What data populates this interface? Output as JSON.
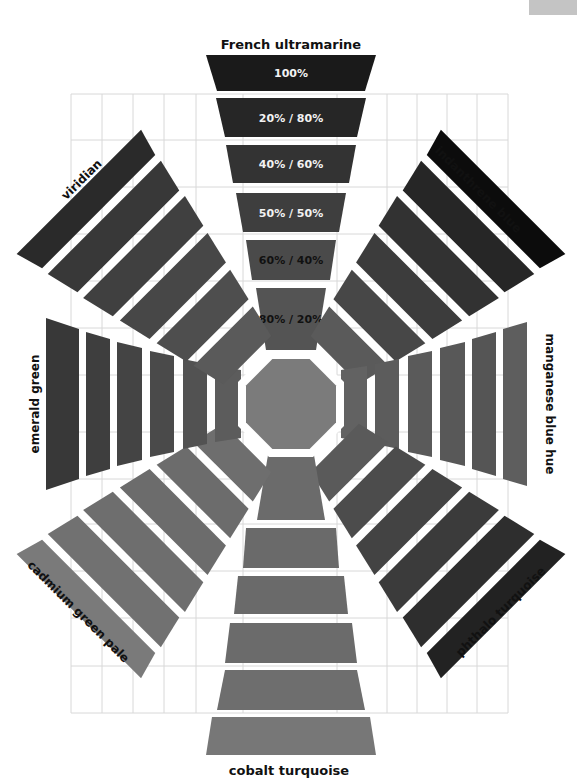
{
  "corner_tab": {
    "color": "#c4c4c4"
  },
  "center": {
    "x": 291,
    "y": 404,
    "octagon_radius": 47,
    "octagon_color": "#7b7b7b"
  },
  "grid": {
    "x0": 71,
    "x1": 508,
    "y0": 94,
    "y1": 713,
    "columns": [
      71,
      102,
      133,
      164,
      196,
      243,
      337,
      387,
      417,
      447,
      477,
      508
    ],
    "rows": [
      94,
      140,
      187,
      234,
      281,
      328,
      375,
      432,
      479,
      524,
      571,
      618,
      666,
      713
    ],
    "color": "#d8d8d8"
  },
  "arms": [
    {
      "name": "French ultramarine",
      "direction": "top",
      "angle": 0,
      "label": {
        "text": "French ultramarine",
        "x": 291,
        "y": 45,
        "rotate": 0,
        "size": 13
      },
      "swatches": [
        {
          "r0": 54,
          "r1": 116,
          "w0": 25,
          "w1": 35,
          "color": "#545454",
          "text": "80% / 20%",
          "text_color": "#111111"
        },
        {
          "r0": 124,
          "r1": 164,
          "w0": 39,
          "w1": 45,
          "color": "#4a4a4a",
          "text": "60% / 40%",
          "text_color": "#111111"
        },
        {
          "r0": 172,
          "r1": 211,
          "w0": 48,
          "w1": 55,
          "color": "#3e3e3e",
          "text": "50% / 50%",
          "text_color": "#f2f2f2"
        },
        {
          "r0": 221,
          "r1": 259,
          "w0": 58,
          "w1": 65,
          "color": "#333333",
          "text": "40% / 60%",
          "text_color": "#f2f2f2"
        },
        {
          "r0": 267,
          "r1": 306,
          "w0": 66,
          "w1": 75,
          "color": "#262626",
          "text": "20% / 80%",
          "text_color": "#f2f2f2"
        },
        {
          "r0": 313,
          "r1": 349,
          "w0": 74,
          "w1": 85,
          "color": "#1a1a1a",
          "text": "100%",
          "text_color": "#f2f2f2"
        }
      ]
    },
    {
      "name": "indanthrene blue",
      "direction": "top-right",
      "angle": 45,
      "label": {
        "text": "indanthrene blue",
        "x": 478,
        "y": 190,
        "rotate": 45,
        "size": 12
      },
      "swatches": [
        {
          "r0": 62,
          "r1": 96,
          "w0": 34,
          "w1": 42,
          "color": "#5a5a5a"
        },
        {
          "r0": 104,
          "r1": 138,
          "w0": 44,
          "w1": 52,
          "color": "#474747"
        },
        {
          "r0": 146,
          "r1": 180,
          "w0": 54,
          "w1": 62,
          "color": "#3c3c3c"
        },
        {
          "r0": 188,
          "r1": 222,
          "w0": 64,
          "w1": 72,
          "color": "#323232"
        },
        {
          "r0": 230,
          "r1": 264,
          "w0": 72,
          "w1": 80,
          "color": "#262626"
        },
        {
          "r0": 272,
          "r1": 300,
          "w0": 80,
          "w1": 88,
          "color": "#0c0c0c"
        }
      ]
    },
    {
      "name": "manganese blue hue",
      "direction": "right",
      "angle": 90,
      "label": {
        "text": "manganese blue hue",
        "x": 549,
        "y": 404,
        "rotate": 90,
        "size": 12
      },
      "swatches": [
        {
          "r0": 50,
          "r1": 76,
          "w0": 34,
          "w1": 38,
          "color": "#626262"
        },
        {
          "r0": 84,
          "r1": 108,
          "w0": 40,
          "w1": 45,
          "color": "#5c5c5c"
        },
        {
          "r0": 117,
          "r1": 141,
          "w0": 48,
          "w1": 53,
          "color": "#5a5a5a"
        },
        {
          "r0": 149,
          "r1": 174,
          "w0": 56,
          "w1": 62,
          "color": "#585858"
        },
        {
          "r0": 181,
          "r1": 205,
          "w0": 65,
          "w1": 72,
          "color": "#555555"
        },
        {
          "r0": 212,
          "r1": 236,
          "w0": 75,
          "w1": 82,
          "color": "#5e5e5e"
        }
      ]
    },
    {
      "name": "phthalo turquoise",
      "direction": "bottom-right",
      "angle": 135,
      "label": {
        "text": "phthalo turquoise",
        "x": 501,
        "y": 612,
        "rotate": -45,
        "size": 12
      },
      "swatches": [
        {
          "r0": 62,
          "r1": 96,
          "w0": 34,
          "w1": 42,
          "color": "#5a5a5a"
        },
        {
          "r0": 104,
          "r1": 138,
          "w0": 44,
          "w1": 52,
          "color": "#4c4c4c"
        },
        {
          "r0": 146,
          "r1": 180,
          "w0": 54,
          "w1": 62,
          "color": "#434343"
        },
        {
          "r0": 188,
          "r1": 222,
          "w0": 64,
          "w1": 72,
          "color": "#3b3b3b"
        },
        {
          "r0": 230,
          "r1": 264,
          "w0": 72,
          "w1": 80,
          "color": "#2e2e2e"
        },
        {
          "r0": 272,
          "r1": 300,
          "w0": 80,
          "w1": 88,
          "color": "#222222"
        }
      ]
    },
    {
      "name": "cobalt turquoise",
      "direction": "bottom",
      "angle": 180,
      "label": {
        "text": "cobalt turquoise",
        "x": 289,
        "y": 771,
        "rotate": 0,
        "size": 13
      },
      "swatches": [
        {
          "r0": 51,
          "r1": 116,
          "w0": 23,
          "w1": 34,
          "color": "#6b6b6b"
        },
        {
          "r0": 124,
          "r1": 164,
          "w0": 45,
          "w1": 48,
          "color": "#6a6a6a"
        },
        {
          "r0": 172,
          "r1": 210,
          "w0": 53,
          "w1": 57,
          "color": "#6a6a6a"
        },
        {
          "r0": 219,
          "r1": 259,
          "w0": 61,
          "w1": 66,
          "color": "#6b6b6b"
        },
        {
          "r0": 266,
          "r1": 306,
          "w0": 66,
          "w1": 74,
          "color": "#6e6e6e"
        },
        {
          "r0": 313,
          "r1": 351,
          "w0": 79,
          "w1": 85,
          "color": "#777777"
        }
      ]
    },
    {
      "name": "cadmium green pale",
      "direction": "bottom-left",
      "angle": 225,
      "label": {
        "text": "cadmium green pale",
        "x": 78,
        "y": 612,
        "rotate": 45,
        "size": 12
      },
      "swatches": [
        {
          "r0": 62,
          "r1": 96,
          "w0": 34,
          "w1": 42,
          "color": "#6e6e6e"
        },
        {
          "r0": 104,
          "r1": 138,
          "w0": 44,
          "w1": 52,
          "color": "#6c6c6c"
        },
        {
          "r0": 146,
          "r1": 180,
          "w0": 54,
          "w1": 62,
          "color": "#6c6c6c"
        },
        {
          "r0": 188,
          "r1": 222,
          "w0": 64,
          "w1": 72,
          "color": "#6e6e6e"
        },
        {
          "r0": 230,
          "r1": 264,
          "w0": 72,
          "w1": 80,
          "color": "#717171"
        },
        {
          "r0": 272,
          "r1": 300,
          "w0": 80,
          "w1": 88,
          "color": "#7a7a7a"
        }
      ]
    },
    {
      "name": "emerald green",
      "direction": "left",
      "angle": 270,
      "label": {
        "text": "emerald green",
        "x": 35,
        "y": 404,
        "rotate": -90,
        "size": 12
      },
      "swatches": [
        {
          "r0": 50,
          "r1": 76,
          "w0": 34,
          "w1": 38,
          "color": "#5c5c5c"
        },
        {
          "r0": 84,
          "r1": 108,
          "w0": 40,
          "w1": 45,
          "color": "#525252"
        },
        {
          "r0": 117,
          "r1": 141,
          "w0": 48,
          "w1": 53,
          "color": "#4a4a4a"
        },
        {
          "r0": 149,
          "r1": 174,
          "w0": 56,
          "w1": 62,
          "color": "#444444"
        },
        {
          "r0": 181,
          "r1": 205,
          "w0": 65,
          "w1": 72,
          "color": "#3e3e3e"
        },
        {
          "r0": 212,
          "r1": 245,
          "w0": 75,
          "w1": 86,
          "color": "#383838"
        }
      ]
    },
    {
      "name": "viridian",
      "direction": "top-left",
      "angle": 315,
      "label": {
        "text": "viridian",
        "x": 82,
        "y": 180,
        "rotate": -45,
        "size": 12
      },
      "swatches": [
        {
          "r0": 62,
          "r1": 96,
          "w0": 34,
          "w1": 42,
          "color": "#5a5a5a"
        },
        {
          "r0": 104,
          "r1": 138,
          "w0": 44,
          "w1": 52,
          "color": "#4e4e4e"
        },
        {
          "r0": 146,
          "r1": 180,
          "w0": 54,
          "w1": 62,
          "color": "#474747"
        },
        {
          "r0": 188,
          "r1": 222,
          "w0": 64,
          "w1": 72,
          "color": "#404040"
        },
        {
          "r0": 230,
          "r1": 264,
          "w0": 72,
          "w1": 80,
          "color": "#383838"
        },
        {
          "r0": 272,
          "r1": 300,
          "w0": 80,
          "w1": 88,
          "color": "#2a2a2a"
        }
      ]
    }
  ]
}
